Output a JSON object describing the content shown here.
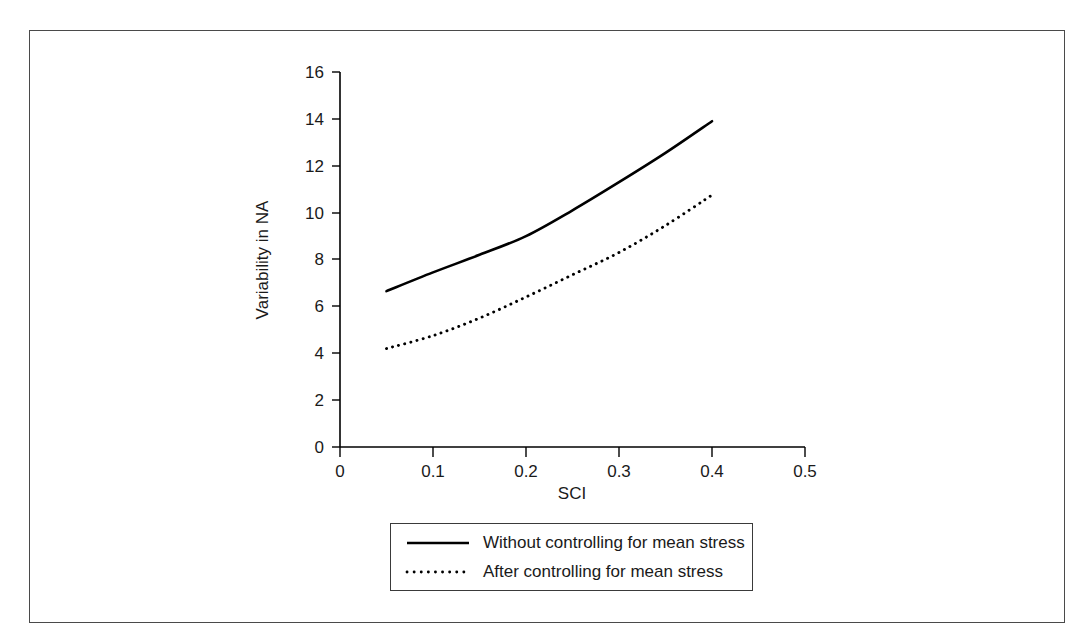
{
  "chart_data": {
    "type": "line",
    "title": "",
    "xlabel": "SCI",
    "ylabel": "Variability in NA",
    "xlim": [
      0,
      0.5
    ],
    "ylim": [
      0,
      16
    ],
    "grid": false,
    "legend_position": "bottom-center",
    "x_ticks": [
      "0",
      "0.1",
      "0.2",
      "0.3",
      "0.4",
      "0.5"
    ],
    "x_tick_values": [
      0,
      0.1,
      0.2,
      0.3,
      0.4,
      0.5
    ],
    "y_ticks": [
      "0",
      "2",
      "4",
      "6",
      "8",
      "10",
      "12",
      "14",
      "16"
    ],
    "y_tick_values": [
      0,
      2,
      4,
      6,
      8,
      10,
      12,
      14,
      16
    ],
    "x": [
      0.05,
      0.1,
      0.15,
      0.2,
      0.25,
      0.3,
      0.35,
      0.4
    ],
    "series": [
      {
        "name": "Without controlling for mean stress",
        "style": "solid",
        "color": "#000000",
        "values": [
          6.65,
          7.45,
          8.2,
          9.0,
          10.1,
          11.3,
          12.55,
          13.9
        ]
      },
      {
        "name": "After controlling for mean stress",
        "style": "dotted",
        "color": "#000000",
        "values": [
          4.2,
          4.75,
          5.5,
          6.4,
          7.35,
          8.3,
          9.45,
          10.75
        ]
      }
    ]
  },
  "axes": {
    "x_title": "SCI",
    "y_title": "Variability in NA"
  },
  "legend": {
    "items": [
      {
        "label": "Without controlling for mean stress",
        "style": "solid"
      },
      {
        "label": "After controlling for mean stress",
        "style": "dotted"
      }
    ]
  },
  "ticks": {
    "x": [
      "0",
      "0.1",
      "0.2",
      "0.3",
      "0.4",
      "0.5"
    ],
    "y": [
      "0",
      "2",
      "4",
      "6",
      "8",
      "10",
      "12",
      "14",
      "16"
    ]
  },
  "colors": {
    "frame": "#4a4a4a",
    "axis": "#000000",
    "series": "#000000",
    "text": "#1a1a1a",
    "background": "#ffffff"
  }
}
